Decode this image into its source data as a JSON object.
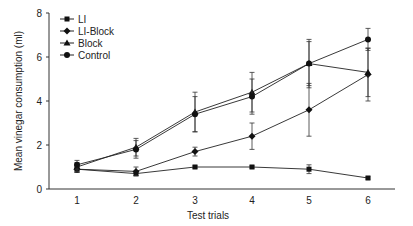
{
  "chart_data": {
    "type": "line",
    "title": "",
    "xlabel": "Test trials",
    "ylabel": "Mean vinegar consumption (ml)",
    "x": [
      1,
      2,
      3,
      4,
      5,
      6
    ],
    "xticks": [
      "1",
      "2",
      "3",
      "4",
      "5",
      "6"
    ],
    "yticks": [
      "0",
      "2",
      "4",
      "6",
      "8"
    ],
    "ylim": [
      0,
      8
    ],
    "grid": false,
    "legend_position": "upper-left",
    "series": [
      {
        "name": "LI",
        "marker": "square",
        "values": [
          0.9,
          0.7,
          1.0,
          1.0,
          0.9,
          0.5
        ],
        "errors": [
          0.15,
          0.1,
          0.05,
          0.05,
          0.2,
          0.05
        ]
      },
      {
        "name": "LI-Block",
        "marker": "diamond",
        "values": [
          0.9,
          0.8,
          1.7,
          2.4,
          3.6,
          5.2
        ],
        "errors": [
          0.15,
          0.2,
          0.2,
          0.6,
          1.2,
          1.2
        ]
      },
      {
        "name": "Block",
        "marker": "triangle",
        "values": [
          1.0,
          1.9,
          3.5,
          4.4,
          5.7,
          5.3
        ],
        "errors": [
          0.2,
          0.4,
          0.9,
          0.9,
          1.1,
          1.1
        ]
      },
      {
        "name": "Control",
        "marker": "circle",
        "values": [
          1.1,
          1.8,
          3.4,
          4.2,
          5.7,
          6.8
        ],
        "errors": [
          0.2,
          0.4,
          0.8,
          0.8,
          1.0,
          0.5
        ]
      }
    ]
  }
}
